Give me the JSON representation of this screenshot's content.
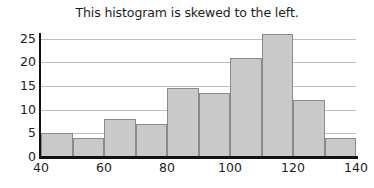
{
  "chart_data": {
    "type": "bar",
    "title": "This histogram is skewed to the left.",
    "xlabel": "",
    "ylabel": "",
    "bin_edges": [
      40,
      50,
      60,
      70,
      80,
      90,
      100,
      110,
      120,
      130,
      140
    ],
    "categories": [
      "40-50",
      "50-60",
      "60-70",
      "70-80",
      "80-90",
      "90-100",
      "100-110",
      "110-120",
      "120-130",
      "130-140"
    ],
    "values": [
      5,
      4,
      8,
      7,
      14.5,
      13.5,
      21,
      26,
      12,
      4
    ],
    "xlim": [
      40,
      140
    ],
    "ylim": [
      0,
      26
    ],
    "x_ticks": [
      40,
      60,
      80,
      100,
      120,
      140
    ],
    "y_ticks": [
      0,
      5,
      10,
      15,
      20,
      25
    ],
    "x_tick_labels": [
      "40",
      "60",
      "80",
      "100",
      "120",
      "140"
    ],
    "y_tick_labels": [
      "0",
      "5",
      "10",
      "15",
      "20",
      "25"
    ],
    "grid": "horizontal",
    "legend": null,
    "bar_fill_color": "#c9c9c9",
    "bar_border_color": "#8a8a8a",
    "gridline_color": "#bfbfbf",
    "axis_color": "#111111",
    "background_color": "#ffffff"
  }
}
